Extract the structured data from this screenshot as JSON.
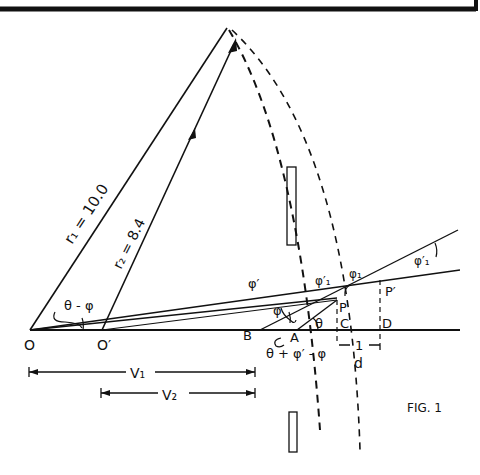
{
  "figure": {
    "caption": "FIG. 1",
    "labels": {
      "r1": "r₁ = 10.0",
      "r2": "r₂ = 8.4",
      "theta_minus_phi": "θ - φ",
      "O": "O",
      "O_prime": "O′",
      "B": "B",
      "A": "A",
      "C": "C",
      "D": "D",
      "P": "P",
      "P_prime": "P′",
      "theta": "θ",
      "phi": "φ",
      "phi_prime_1": "φ′",
      "phi_prime_2": "φ′₁",
      "phi_1": "φ₁",
      "phi_prime_right": "φ′₁",
      "angle_expr": "θ + φ′ - φ",
      "one": "1",
      "d": "d",
      "V1": "V₁",
      "V2": "V₂"
    }
  }
}
